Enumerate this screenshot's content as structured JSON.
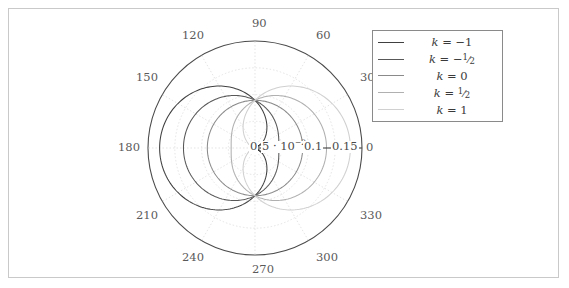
{
  "figure": {
    "background": "#ffffff",
    "frame_color": "#c9c9c9",
    "width": 569,
    "height": 288
  },
  "chart_data": {
    "type": "line",
    "coordinate_system": "polar",
    "title": "",
    "xlabel": "",
    "ylabel": "",
    "rlim": [
      0,
      0.175
    ],
    "grid": true,
    "legend_position": "top-right",
    "angular_axis": {
      "unit": "degrees",
      "tick_step": 30,
      "tick_labels": [
        "0",
        "30",
        "60",
        "90",
        "120",
        "150",
        "180",
        "210",
        "240",
        "270",
        "300",
        "330"
      ],
      "tick_values": [
        0,
        30,
        60,
        90,
        120,
        150,
        180,
        210,
        240,
        270,
        300,
        330
      ]
    },
    "radial_axis": {
      "tick_labels": [
        "0",
        "5 · 10⁻²",
        "0.1",
        "0.15"
      ],
      "tick_values": [
        0,
        0.05,
        0.1,
        0.15
      ],
      "label_angle_deg": 0
    },
    "series": [
      {
        "name": "k = -1",
        "k": -1,
        "color": "#404040",
        "r_max": 0.156,
        "r_at_0deg": 0.0,
        "r_at_90deg": 0.078,
        "r_at_180deg": 0.156,
        "formula": "r = 0.078 * (1 - cos(theta))"
      },
      {
        "name": "k = -1/2",
        "k": -0.5,
        "color": "#585858",
        "r_max": 0.117,
        "r_at_0deg": 0.039,
        "r_at_90deg": 0.078,
        "r_at_180deg": 0.117,
        "formula": "r = 0.078 * (1 - 0.5*cos(theta))"
      },
      {
        "name": "k = 0",
        "k": 0,
        "color": "#8a8a8a",
        "r_max": 0.078,
        "r_at_0deg": 0.078,
        "r_at_90deg": 0.078,
        "r_at_180deg": 0.078,
        "formula": "r = 0.078"
      },
      {
        "name": "k = 1/2",
        "k": 0.5,
        "color": "#b0b0b0",
        "r_max": 0.117,
        "r_at_0deg": 0.117,
        "r_at_90deg": 0.078,
        "r_at_180deg": 0.039,
        "formula": "r = 0.078 * (1 + 0.5*cos(theta))"
      },
      {
        "name": "k = 1",
        "k": 1,
        "color": "#d0d0d0",
        "r_max": 0.156,
        "r_at_0deg": 0.156,
        "r_at_90deg": 0.078,
        "r_at_180deg": 0.0,
        "formula": "r = 0.078 * (1 + cos(theta))"
      }
    ]
  },
  "legend": {
    "border_color": "#8a8a8a",
    "entries": [
      {
        "label_prefix": "k",
        "equals": "=",
        "value": "−1",
        "value_type": "plain",
        "color": "#404040"
      },
      {
        "label_prefix": "k",
        "equals": "=",
        "value": "−1/2",
        "value_type": "frac",
        "sign": "−",
        "num": "1",
        "den": "2",
        "color": "#585858"
      },
      {
        "label_prefix": "k",
        "equals": "=",
        "value": "0",
        "value_type": "plain",
        "color": "#8a8a8a"
      },
      {
        "label_prefix": "k",
        "equals": "=",
        "value": "1/2",
        "value_type": "frac",
        "sign": "",
        "num": "1",
        "den": "2",
        "color": "#b0b0b0"
      },
      {
        "label_prefix": "k",
        "equals": "=",
        "value": "1",
        "value_type": "plain",
        "color": "#d0d0d0"
      }
    ]
  },
  "angle_labels": [
    {
      "text": "90",
      "x": 252,
      "y": 18
    },
    {
      "text": "120",
      "x": 182,
      "y": 30
    },
    {
      "text": "60",
      "x": 316,
      "y": 30
    },
    {
      "text": "150",
      "x": 136,
      "y": 72
    },
    {
      "text": "30",
      "x": 360,
      "y": 72
    },
    {
      "text": "180",
      "x": 118,
      "y": 142
    },
    {
      "text": "0",
      "x": 366,
      "y": 142
    },
    {
      "text": "210",
      "x": 136,
      "y": 210
    },
    {
      "text": "330",
      "x": 360,
      "y": 210
    },
    {
      "text": "240",
      "x": 182,
      "y": 252
    },
    {
      "text": "300",
      "x": 316,
      "y": 252
    },
    {
      "text": "270",
      "x": 252,
      "y": 264
    }
  ],
  "radial_labels": [
    {
      "id": "r0",
      "text": "0",
      "x": 249,
      "y": 141
    },
    {
      "id": "r005",
      "text": "5 · 10",
      "sup": "−2",
      "x": 261,
      "y": 141
    },
    {
      "id": "r01",
      "text": "0.1",
      "x": 303,
      "y": 141
    },
    {
      "id": "r015",
      "text": "0.15",
      "x": 331,
      "y": 141
    }
  ],
  "plot_geometry": {
    "center_x": 255,
    "center_y": 148,
    "outer_radius_px": 107,
    "r_unit_px": 611.4,
    "grid_circle_radii_px": [
      26.7,
      53.4,
      80.2,
      107.0
    ],
    "grid_color": "#d8d8d8",
    "outer_circle_color": "#4a4a4a",
    "axis_line_color": "#333333"
  }
}
